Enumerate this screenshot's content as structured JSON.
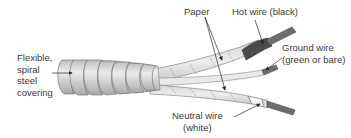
{
  "diagram": {
    "labels": {
      "covering": [
        "Flexible,",
        "spiral",
        "steel",
        "covering"
      ],
      "paper": "Paper",
      "hot_wire": "Hot wire (black)",
      "ground_wire": [
        "Ground wire",
        "(green or bare)"
      ],
      "neutral_wire": [
        "Neutral wire",
        "(white)"
      ]
    },
    "colors": {
      "background": "#ffffff",
      "steel": "#d6d6d6",
      "steel_edge": "#7a7a7a",
      "paper": "#e4e4e4",
      "hot_insulation": "#4a4a4a",
      "copper_conductor": "#6e6e6e",
      "neutral_insulation": "#f4f4f4",
      "label_text": "#3a3a3a",
      "leader_line": "#2a2a2a"
    }
  }
}
